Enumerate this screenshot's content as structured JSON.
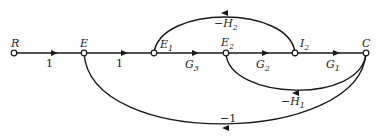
{
  "diagram": {
    "type": "signal-flow-graph",
    "nodes": [
      {
        "id": "R",
        "label": "R",
        "sub": ""
      },
      {
        "id": "E",
        "label": "E",
        "sub": ""
      },
      {
        "id": "E1",
        "label": "E",
        "sub": "1"
      },
      {
        "id": "E2",
        "label": "E",
        "sub": "2"
      },
      {
        "id": "I2",
        "label": "I",
        "sub": "2"
      },
      {
        "id": "C",
        "label": "C",
        "sub": ""
      }
    ],
    "edges": [
      {
        "from": "R",
        "to": "E",
        "gain": "1",
        "gain_sub": ""
      },
      {
        "from": "E",
        "to": "E1",
        "gain": "1",
        "gain_sub": ""
      },
      {
        "from": "E1",
        "to": "E2",
        "gain": "G",
        "gain_sub": "3"
      },
      {
        "from": "E2",
        "to": "I2",
        "gain": "G",
        "gain_sub": "2"
      },
      {
        "from": "I2",
        "to": "C",
        "gain": "G",
        "gain_sub": "1"
      },
      {
        "from": "I2",
        "to": "E1",
        "gain": "−H",
        "gain_sub": "2"
      },
      {
        "from": "C",
        "to": "E2",
        "gain": "−H",
        "gain_sub": "1"
      },
      {
        "from": "C",
        "to": "E",
        "gain": "−1",
        "gain_sub": ""
      }
    ]
  }
}
